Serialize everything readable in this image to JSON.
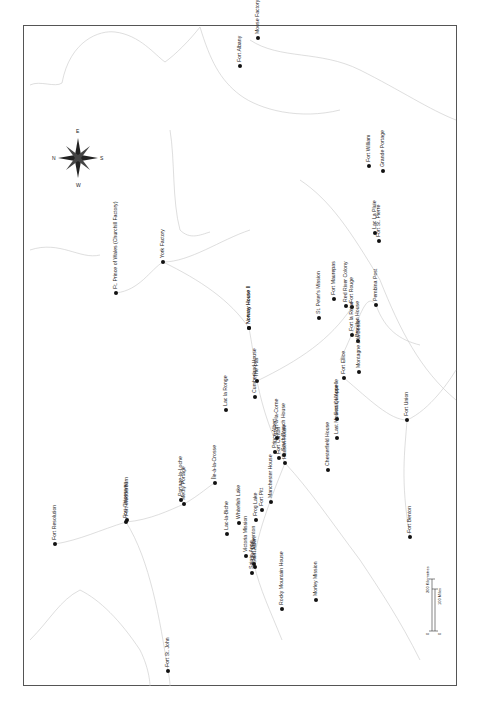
{
  "map": {
    "orientation": "rotated 90 degrees; north points left",
    "compass": {
      "n": "N",
      "e": "E",
      "s": "S",
      "w": "W"
    },
    "scale": {
      "km_label": "200 Kilometres",
      "mi_label": "100 Miles",
      "zero_km": "0",
      "zero_mi": "0"
    },
    "places": [
      {
        "name": "Fort Albany",
        "x": 240,
        "y": 66
      },
      {
        "name": "Moose Factory",
        "x": 258,
        "y": 38
      },
      {
        "name": "Fort William",
        "x": 369,
        "y": 166
      },
      {
        "name": "Grande Portage",
        "x": 383,
        "y": 171
      },
      {
        "name": "Lac La Pluie",
        "x": 375,
        "y": 233
      },
      {
        "name": "Fort St. Pierre",
        "x": 379,
        "y": 241
      },
      {
        "name": "Pembina Post",
        "x": 376,
        "y": 305
      },
      {
        "name": "Ft. Prince of Wales (Churchill Factory)",
        "x": 116,
        "y": 293
      },
      {
        "name": "York Factory",
        "x": 163,
        "y": 262
      },
      {
        "name": "Norway House II",
        "x": 249,
        "y": 328
      },
      {
        "name": "Norway House I",
        "x": 249,
        "y": 328
      },
      {
        "name": "Fort Maurepas",
        "x": 334,
        "y": 299
      },
      {
        "name": "Red River Colony",
        "x": 346,
        "y": 306
      },
      {
        "name": "Fort Rouge",
        "x": 352,
        "y": 307
      },
      {
        "name": "St. Peter's Mission",
        "x": 319,
        "y": 318
      },
      {
        "name": "Fort la Reine",
        "x": 352,
        "y": 335
      },
      {
        "name": "Brandon House",
        "x": 358,
        "y": 341
      },
      {
        "name": "Fort Ellice",
        "x": 344,
        "y": 378
      },
      {
        "name": "Montagne à la Bosse",
        "x": 359,
        "y": 372
      },
      {
        "name": "The Pas",
        "x": 257,
        "y": 381
      },
      {
        "name": "Cumberland House",
        "x": 255,
        "y": 397
      },
      {
        "name": "Fort Qu'Appelle",
        "x": 337,
        "y": 419
      },
      {
        "name": "Fort-à-la-Corne",
        "x": 277,
        "y": 438
      },
      {
        "name": "South Branch House",
        "x": 284,
        "y": 455
      },
      {
        "name": "Prince Albert",
        "x": 275,
        "y": 452
      },
      {
        "name": "Fort Carlton",
        "x": 279,
        "y": 458
      },
      {
        "name": "Hudson House",
        "x": 285,
        "y": 463
      },
      {
        "name": "Last Mountain House",
        "x": 337,
        "y": 438
      },
      {
        "name": "Chesterfield House",
        "x": 328,
        "y": 470
      },
      {
        "name": "Lac la Ronge",
        "x": 226,
        "y": 410
      },
      {
        "name": "Portage-la-Loche",
        "x": 181,
        "y": 500
      },
      {
        "name": "Methy Portage",
        "x": 184,
        "y": 504
      },
      {
        "name": "Île-à-la-Crosse",
        "x": 215,
        "y": 483
      },
      {
        "name": "Lac-la-Biche",
        "x": 227,
        "y": 534
      },
      {
        "name": "Whitefish Lake",
        "x": 239,
        "y": 523
      },
      {
        "name": "Frog Lake",
        "x": 256,
        "y": 520
      },
      {
        "name": "Fort Pitt",
        "x": 262,
        "y": 510
      },
      {
        "name": "Manchester House",
        "x": 271,
        "y": 502
      },
      {
        "name": "Fort Edmonton",
        "x": 254,
        "y": 564
      },
      {
        "name": "Victoria Mission",
        "x": 246,
        "y": 556
      },
      {
        "name": "Sainte-Anne",
        "x": 252,
        "y": 573
      },
      {
        "name": "Saint Albert",
        "x": 255,
        "y": 567
      },
      {
        "name": "Rocky Mountain House",
        "x": 282,
        "y": 609
      },
      {
        "name": "Morley Mission",
        "x": 316,
        "y": 600
      },
      {
        "name": "Fort Resolution",
        "x": 55,
        "y": 544
      },
      {
        "name": "Fort Chipewyan",
        "x": 126,
        "y": 522
      },
      {
        "name": "Fort Wedderburn",
        "x": 127,
        "y": 520
      },
      {
        "name": "Fort St. John",
        "x": 168,
        "y": 671
      },
      {
        "name": "Fort Union",
        "x": 407,
        "y": 420
      },
      {
        "name": "Fort Benton",
        "x": 410,
        "y": 537
      }
    ]
  }
}
